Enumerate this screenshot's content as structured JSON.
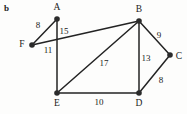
{
  "figure": {
    "panel_label": "b",
    "background_color": "#fdfdfc",
    "edge_color": "#232323",
    "node_color": "#2b2b2b",
    "text_color": "#1b1b1b",
    "width": 187,
    "height": 114
  },
  "chart_data": {
    "type": "diagram",
    "title": "b",
    "subtitle": "",
    "xlabel": "",
    "ylabel": "",
    "graph_kind": "undirected weighted graph",
    "nodes": [
      {
        "id": "A",
        "label": "A",
        "x": 57,
        "y": 19,
        "label_x": 57,
        "label_y": 8
      },
      {
        "id": "B",
        "label": "B",
        "x": 139,
        "y": 21,
        "label_x": 139,
        "label_y": 10
      },
      {
        "id": "C",
        "label": "C",
        "x": 170,
        "y": 55,
        "label_x": 179,
        "label_y": 57
      },
      {
        "id": "D",
        "label": "D",
        "x": 139,
        "y": 93,
        "label_x": 139,
        "label_y": 104
      },
      {
        "id": "E",
        "label": "E",
        "x": 57,
        "y": 93,
        "label_x": 57,
        "label_y": 104
      },
      {
        "id": "F",
        "label": "F",
        "x": 32,
        "y": 45,
        "label_x": 22,
        "label_y": 45
      }
    ],
    "edges": [
      {
        "source": "F",
        "target": "A",
        "weight": 8,
        "label": "8",
        "label_x": 38,
        "label_y": 25
      },
      {
        "source": "A",
        "target": "E",
        "weight": 15,
        "label": "15",
        "label_x": 64,
        "label_y": 31
      },
      {
        "source": "F",
        "target": "B",
        "weight": 11,
        "label": "11",
        "label_x": 48,
        "label_y": 50
      },
      {
        "source": "B",
        "target": "E",
        "weight": 17,
        "label": "17",
        "label_x": 104,
        "label_y": 63
      },
      {
        "source": "B",
        "target": "C",
        "weight": 9,
        "label": "9",
        "label_x": 159,
        "label_y": 35
      },
      {
        "source": "B",
        "target": "D",
        "weight": 13,
        "label": "13",
        "label_x": 146,
        "label_y": 58
      },
      {
        "source": "C",
        "target": "D",
        "weight": 8,
        "label": "8",
        "label_x": 161,
        "label_y": 80
      },
      {
        "source": "E",
        "target": "D",
        "weight": 10,
        "label": "10",
        "label_x": 99,
        "label_y": 102
      }
    ]
  }
}
